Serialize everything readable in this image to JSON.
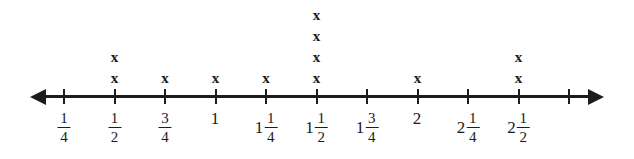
{
  "figure": {
    "type": "dot-plot-on-number-line",
    "axis": {
      "left_arrow": "arrow-left-icon",
      "right_arrow": "arrow-right-icon",
      "tick_count": 11,
      "pixel_start": 64,
      "pixel_spacing": 50.5
    },
    "mark_glyph": "x",
    "ticks": [
      {
        "index": 0,
        "whole": "",
        "numerator": "1",
        "denominator": "4",
        "value": 0.25,
        "x_count": 0
      },
      {
        "index": 1,
        "whole": "",
        "numerator": "1",
        "denominator": "2",
        "value": 0.5,
        "x_count": 2
      },
      {
        "index": 2,
        "whole": "",
        "numerator": "3",
        "denominator": "4",
        "value": 0.75,
        "x_count": 1
      },
      {
        "index": 3,
        "whole": "1",
        "numerator": "",
        "denominator": "",
        "value": 1.0,
        "x_count": 1
      },
      {
        "index": 4,
        "whole": "1",
        "numerator": "1",
        "denominator": "4",
        "value": 1.25,
        "x_count": 1
      },
      {
        "index": 5,
        "whole": "1",
        "numerator": "1",
        "denominator": "2",
        "value": 1.5,
        "x_count": 4
      },
      {
        "index": 6,
        "whole": "1",
        "numerator": "3",
        "denominator": "4",
        "value": 1.75,
        "x_count": 0
      },
      {
        "index": 7,
        "whole": "2",
        "numerator": "",
        "denominator": "",
        "value": 2.0,
        "x_count": 1
      },
      {
        "index": 8,
        "whole": "2",
        "numerator": "1",
        "denominator": "4",
        "value": 2.25,
        "x_count": 0
      },
      {
        "index": 9,
        "whole": "2",
        "numerator": "1",
        "denominator": "2",
        "value": 2.5,
        "x_count": 2
      },
      {
        "index": 10,
        "whole": "",
        "numerator": "",
        "denominator": "",
        "value": 2.75,
        "x_count": 0
      }
    ]
  },
  "chart_data": {
    "type": "scatter",
    "title": "",
    "xlabel": "",
    "ylabel": "",
    "categories": [
      "1/4",
      "1/2",
      "3/4",
      "1",
      "1 1/4",
      "1 1/2",
      "1 3/4",
      "2",
      "2 1/4",
      "2 1/2"
    ],
    "x": [
      0.25,
      0.5,
      0.75,
      1.0,
      1.25,
      1.5,
      1.75,
      2.0,
      2.25,
      2.5
    ],
    "values": [
      0,
      2,
      1,
      1,
      1,
      4,
      0,
      1,
      0,
      2
    ],
    "xlim": [
      0.25,
      2.75
    ],
    "grid": false,
    "legend": "none"
  },
  "colors": {
    "ink": "#1c1c1c",
    "background": "#ffffff"
  }
}
